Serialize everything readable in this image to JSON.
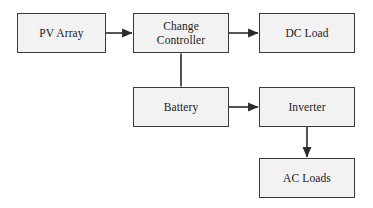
{
  "diagram": {
    "background_color": "#ffffff",
    "node_fill_color": "#f2f2f2",
    "node_border_color": "#3a3a3a",
    "edge_color": "#2b2b2b",
    "nodes": [
      {
        "id": "pv-array",
        "label": "PV Array",
        "x": 17,
        "y": 13,
        "w": 89,
        "h": 40
      },
      {
        "id": "change-controller",
        "label": "Change\nController",
        "x": 133,
        "y": 13,
        "w": 96,
        "h": 40
      },
      {
        "id": "dc-load",
        "label": "DC Load",
        "x": 259,
        "y": 13,
        "w": 96,
        "h": 40
      },
      {
        "id": "battery",
        "label": "Battery",
        "x": 133,
        "y": 87,
        "w": 96,
        "h": 40
      },
      {
        "id": "inverter",
        "label": "Inverter",
        "x": 259,
        "y": 87,
        "w": 96,
        "h": 40
      },
      {
        "id": "ac-loads",
        "label": "AC Loads",
        "x": 259,
        "y": 158,
        "w": 96,
        "h": 40
      }
    ],
    "edges": [
      {
        "id": "pv-to-controller",
        "from": "pv-array",
        "to": "change-controller",
        "direction": "one-way"
      },
      {
        "id": "controller-to-dc-load",
        "from": "change-controller",
        "to": "dc-load",
        "direction": "one-way"
      },
      {
        "id": "controller-battery",
        "from": "change-controller",
        "to": "battery",
        "direction": "two-way"
      },
      {
        "id": "battery-to-inverter",
        "from": "battery",
        "to": "inverter",
        "direction": "one-way"
      },
      {
        "id": "inverter-to-ac-loads",
        "from": "inverter",
        "to": "ac-loads",
        "direction": "one-way"
      }
    ]
  }
}
